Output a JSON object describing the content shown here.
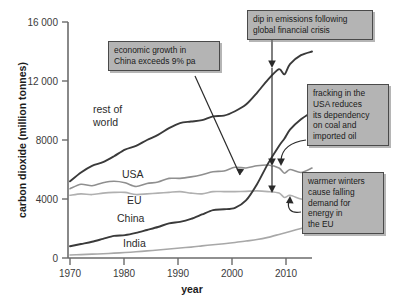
{
  "chart_data": {
    "type": "line",
    "title": "",
    "xlabel": "year",
    "ylabel": "carbon dioxide (million tonnes)",
    "xlim": [
      1970,
      2014
    ],
    "ylim": [
      0,
      16000
    ],
    "xticks": [
      "1970",
      "1980",
      "1990",
      "2000",
      "2010"
    ],
    "xtick_values": [
      1970,
      1980,
      1990,
      2000,
      2010
    ],
    "yticks": [
      "0",
      "4000",
      "8000",
      "12 000",
      "16 000"
    ],
    "ytick_values": [
      0,
      4000,
      8000,
      12000,
      16000
    ],
    "grid": false,
    "legend": "inline-labels",
    "x": [
      1970,
      1972,
      1974,
      1976,
      1978,
      1980,
      1982,
      1984,
      1986,
      1988,
      1990,
      1992,
      1994,
      1996,
      1998,
      2000,
      2002,
      2004,
      2006,
      2008,
      2009,
      2010,
      2012,
      2014
    ],
    "series": [
      {
        "name": "rest of world",
        "color": "#3a3a3a",
        "values": [
          5200,
          5800,
          6250,
          6500,
          6900,
          7350,
          7600,
          8000,
          8350,
          8800,
          9150,
          9250,
          9350,
          9600,
          9650,
          9950,
          10400,
          11200,
          12100,
          12800,
          12450,
          13150,
          13750,
          14000
        ]
      },
      {
        "name": "USA",
        "color": "#8f8f8f",
        "values": [
          4700,
          5000,
          4900,
          5100,
          5200,
          5100,
          4850,
          5050,
          5150,
          5400,
          5400,
          5500,
          5650,
          5850,
          5900,
          6150,
          6100,
          6250,
          6300,
          6100,
          5750,
          6000,
          5800,
          6100
        ]
      },
      {
        "name": "EU",
        "color": "#b0b0b0",
        "values": [
          4250,
          4350,
          4300,
          4400,
          4450,
          4450,
          4300,
          4350,
          4400,
          4450,
          4500,
          4400,
          4350,
          4500,
          4500,
          4500,
          4520,
          4550,
          4500,
          4400,
          4100,
          4250,
          4000,
          3900
        ]
      },
      {
        "name": "China",
        "color": "#3a3a3a",
        "values": [
          800,
          950,
          1100,
          1300,
          1500,
          1550,
          1700,
          1900,
          2100,
          2350,
          2450,
          2650,
          2950,
          3250,
          3300,
          3400,
          3900,
          5000,
          6400,
          7600,
          8100,
          8700,
          9400,
          9900
        ]
      },
      {
        "name": "India",
        "color": "#a8a8a8",
        "values": [
          200,
          230,
          260,
          290,
          330,
          370,
          420,
          480,
          540,
          610,
          680,
          740,
          820,
          900,
          970,
          1050,
          1150,
          1250,
          1400,
          1600,
          1700,
          1800,
          2000,
          2200
        ]
      }
    ],
    "series_labels": [
      {
        "name": "rest of world",
        "line1": "rest of",
        "line2": "world"
      },
      {
        "name": "USA",
        "line1": "USA",
        "line2": ""
      },
      {
        "name": "EU",
        "line1": "EU",
        "line2": ""
      },
      {
        "name": "China",
        "line1": "China",
        "line2": ""
      },
      {
        "name": "India",
        "line1": "India",
        "line2": ""
      }
    ],
    "annotations": [
      {
        "id": "china-growth",
        "text": "economic growth in\nChina exceeds 9% pa",
        "points_to": "china-line-2003"
      },
      {
        "id": "financial-crisis-dip",
        "text": "dip in emissions following\nglobal financial crisis",
        "points_to": "2009-dip-all-series"
      },
      {
        "id": "usa-fracking",
        "text": "fracking in the\nUSA reduces\nits dependency\non coal and\nimported oil",
        "points_to": "usa-line-2012"
      },
      {
        "id": "eu-warm-winters",
        "text": "warmer winters\ncause falling\ndemand for\nenergy in\nthe EU",
        "points_to": "eu-line-2012"
      }
    ]
  }
}
